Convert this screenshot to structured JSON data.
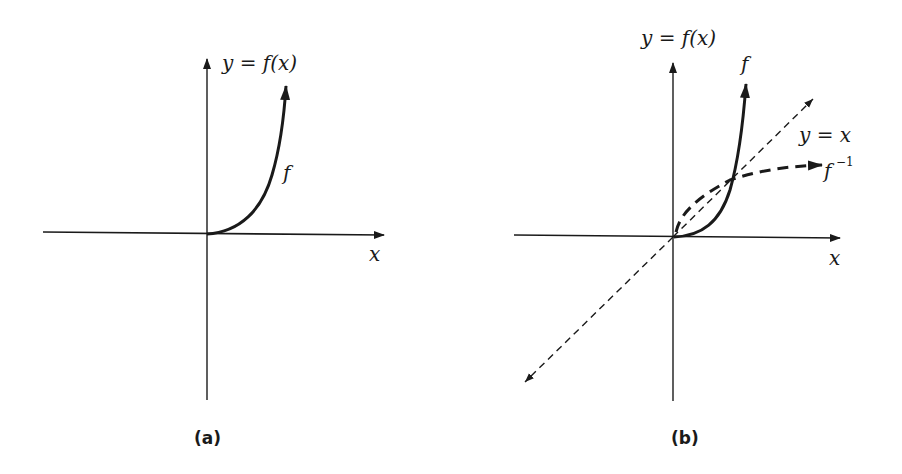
{
  "panels": [
    {
      "id": "a",
      "caption": "(a)",
      "y_axis_label": "y = f(x)",
      "x_axis_label": "x",
      "curve_labels": {
        "f": "f"
      }
    },
    {
      "id": "b",
      "caption": "(b)",
      "y_axis_label": "y = f(x)",
      "x_axis_label": "x",
      "curve_labels": {
        "f": "f",
        "identity": "y = x",
        "inverse": "f",
        "inverse_sup": "−1"
      }
    }
  ],
  "colors": {
    "ink": "#1a1a1a",
    "background": "#ffffff"
  }
}
